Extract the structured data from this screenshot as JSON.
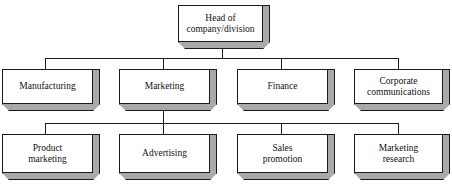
{
  "diagram": {
    "type": "organization-chart",
    "style": {
      "box_fill": "#ffffff",
      "box_extrusion_fill": "#a9a9a9",
      "line_color": "#1a1a1a",
      "text_color": "#111111",
      "background": "#ffffff"
    },
    "levels": [
      {
        "level": 1,
        "nodes": [
          {
            "id": "head",
            "label": "Head of\ncompany/division"
          }
        ]
      },
      {
        "level": 2,
        "nodes": [
          {
            "id": "manufacturing",
            "label": "Manufacturing"
          },
          {
            "id": "marketing",
            "label": "Marketing"
          },
          {
            "id": "finance",
            "label": "Finance"
          },
          {
            "id": "corporate-communications",
            "label": "Corporate\ncommunications"
          }
        ]
      },
      {
        "level": 3,
        "nodes": [
          {
            "id": "product-marketing",
            "label": "Product\nmarketing"
          },
          {
            "id": "advertising",
            "label": "Advertising"
          },
          {
            "id": "sales-promotion",
            "label": "Sales\npromotion"
          },
          {
            "id": "marketing-research",
            "label": "Marketing\nresearch"
          }
        ]
      }
    ],
    "edges": [
      {
        "from": "head",
        "to": "manufacturing"
      },
      {
        "from": "head",
        "to": "marketing"
      },
      {
        "from": "head",
        "to": "finance"
      },
      {
        "from": "head",
        "to": "corporate-communications"
      },
      {
        "from": "marketing",
        "to": "product-marketing"
      },
      {
        "from": "marketing",
        "to": "advertising"
      },
      {
        "from": "marketing",
        "to": "sales-promotion"
      },
      {
        "from": "marketing",
        "to": "marketing-research"
      }
    ]
  }
}
